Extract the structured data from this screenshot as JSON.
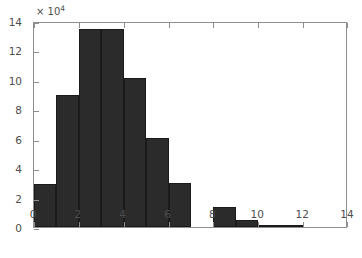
{
  "chart_data": {
    "type": "bar",
    "title": "",
    "subtitle": "",
    "xlabel": "",
    "ylabel": "",
    "y_exponent_label": "× 10",
    "y_exponent_power": "4",
    "y_scale_factor": 10000,
    "xlim": [
      0,
      14
    ],
    "ylim": [
      0,
      14
    ],
    "xticks": [
      0,
      2,
      4,
      6,
      8,
      10,
      12,
      14
    ],
    "xticklabels": [
      "0",
      "2",
      "4",
      "6",
      "8",
      "10",
      "12",
      "14"
    ],
    "yticks": [
      0,
      2,
      4,
      6,
      8,
      10,
      12,
      14
    ],
    "yticklabels": [
      "0",
      "2",
      "4",
      "6",
      "8",
      "10",
      "12",
      "14"
    ],
    "grid": false,
    "legend": null,
    "bar_color": "#2b2b2b",
    "bar_edge_color": "#1a1a1a",
    "axis_color": "#8e8e8e",
    "tick_label_color": "#4d4d4d",
    "background_color": "#ffffff",
    "bin_width": 1,
    "bins": [
      {
        "x0": 0,
        "x1": 1,
        "value": 2.95
      },
      {
        "x0": 1,
        "x1": 2,
        "value": 8.95
      },
      {
        "x0": 2,
        "x1": 3,
        "value": 13.45
      },
      {
        "x0": 3,
        "x1": 4,
        "value": 13.45
      },
      {
        "x0": 4,
        "x1": 5,
        "value": 10.1
      },
      {
        "x0": 5,
        "x1": 6,
        "value": 6.05
      },
      {
        "x0": 6,
        "x1": 7,
        "value": 3.0
      },
      {
        "x0": 7,
        "x1": 8,
        "value": 0.0
      },
      {
        "x0": 8,
        "x1": 9,
        "value": 1.35
      },
      {
        "x0": 9,
        "x1": 10,
        "value": 0.48
      },
      {
        "x0": 10,
        "x1": 11,
        "value": 0.15
      },
      {
        "x0": 11,
        "x1": 12,
        "value": 0.05
      },
      {
        "x0": 12,
        "x1": 13,
        "value": 0.0
      },
      {
        "x0": 13,
        "x1": 14,
        "value": 0.0
      }
    ],
    "categories": [
      "0-1",
      "1-2",
      "2-3",
      "3-4",
      "4-5",
      "5-6",
      "6-7",
      "7-8",
      "8-9",
      "9-10",
      "10-11",
      "11-12",
      "12-13",
      "13-14"
    ],
    "values": [
      2.95,
      8.95,
      13.45,
      13.45,
      10.1,
      6.05,
      3.0,
      0.0,
      1.35,
      0.48,
      0.15,
      0.05,
      0.0,
      0.0
    ]
  }
}
